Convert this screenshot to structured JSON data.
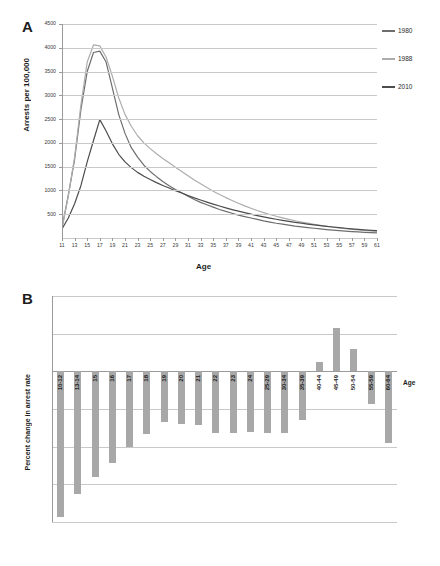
{
  "chart_data": [
    {
      "type": "line",
      "panel": "A",
      "title": "",
      "xlabel": "Age",
      "ylabel": "Arrests per 100,000",
      "xlim": [
        11,
        61
      ],
      "ylim": [
        0,
        4500
      ],
      "ytick_labels": [
        "0",
        "500",
        "1000",
        "1500",
        "2000",
        "2500",
        "3000",
        "3500",
        "4000",
        "4500"
      ],
      "xtick_labels": [
        "11",
        "13",
        "15",
        "17",
        "19",
        "21",
        "23",
        "25",
        "27",
        "29",
        "31",
        "33",
        "35",
        "37",
        "39",
        "41",
        "43",
        "45",
        "47",
        "49",
        "51",
        "53",
        "55",
        "57",
        "59",
        "61"
      ],
      "grid": true,
      "legend_position": "right",
      "x": [
        11,
        12,
        13,
        14,
        15,
        16,
        17,
        18,
        19,
        20,
        21,
        22,
        23,
        24,
        25,
        26,
        27,
        28,
        29,
        30,
        31,
        32,
        33,
        34,
        35,
        36,
        37,
        38,
        39,
        40,
        41,
        42,
        43,
        44,
        45,
        46,
        47,
        48,
        49,
        50,
        51,
        52,
        53,
        54,
        55,
        56,
        57,
        58,
        59,
        60,
        61
      ],
      "series": [
        {
          "name": "1980",
          "color": "#6e6e6e",
          "values": [
            210,
            900,
            1650,
            2700,
            3500,
            3900,
            3930,
            3700,
            3150,
            2600,
            2200,
            1900,
            1700,
            1530,
            1400,
            1290,
            1190,
            1100,
            1020,
            950,
            880,
            810,
            750,
            700,
            650,
            600,
            560,
            520,
            480,
            450,
            420,
            390,
            360,
            335,
            310,
            290,
            270,
            250,
            235,
            220,
            205,
            190,
            178,
            166,
            155,
            145,
            136,
            128,
            120,
            113,
            106
          ]
        },
        {
          "name": "1988",
          "color": "#adadad",
          "values": [
            200,
            880,
            1700,
            2800,
            3700,
            4060,
            4040,
            3800,
            3400,
            2950,
            2600,
            2350,
            2150,
            2000,
            1880,
            1770,
            1670,
            1580,
            1490,
            1400,
            1310,
            1220,
            1140,
            1060,
            985,
            915,
            850,
            790,
            730,
            675,
            625,
            578,
            535,
            495,
            458,
            424,
            392,
            363,
            336,
            311,
            288,
            267,
            247,
            229,
            212,
            197,
            183,
            170,
            158,
            147,
            137
          ]
        },
        {
          "name": "2010",
          "color": "#4d4d4d",
          "values": [
            190,
            420,
            720,
            1100,
            1600,
            2050,
            2490,
            2250,
            1980,
            1760,
            1600,
            1480,
            1380,
            1300,
            1230,
            1165,
            1105,
            1050,
            995,
            945,
            895,
            845,
            800,
            755,
            712,
            672,
            634,
            598,
            564,
            532,
            501,
            472,
            445,
            419,
            395,
            372,
            350,
            330,
            311,
            293,
            276,
            260,
            245,
            231,
            218,
            205,
            193,
            182,
            172,
            162,
            153
          ]
        }
      ]
    },
    {
      "type": "bar",
      "panel": "B",
      "title": "",
      "xlabel": "Age",
      "ylabel": "Percent change in arrest rate",
      "ylim": [
        -80,
        40
      ],
      "ytick_labels": [
        "40",
        "20",
        "0",
        "-20",
        "-40",
        "-60",
        "-80"
      ],
      "grid": true,
      "bar_color": "#a8a8a8",
      "categories": [
        "10-12",
        "13-14",
        "15",
        "16",
        "17",
        "18",
        "19",
        "20",
        "21",
        "22",
        "23",
        "24",
        "25-29",
        "30-34",
        "35-39",
        "40-44",
        "45-49",
        "50-54",
        "55-59",
        "60-64"
      ],
      "values": [
        -77.5,
        -65,
        -56,
        -48.5,
        -40,
        -33.5,
        -27,
        -28,
        -28.5,
        -33,
        -33,
        -32,
        -33,
        -33,
        -26,
        5,
        23,
        12,
        -17.5,
        -38
      ]
    }
  ],
  "panel_a": {
    "letter": "A",
    "ylabel": "Arrests per 100,000",
    "xlabel": "Age",
    "legend": [
      {
        "label": "1980",
        "color": "#6e6e6e"
      },
      {
        "label": "1988",
        "color": "#adadad"
      },
      {
        "label": "2010",
        "color": "#4d4d4d"
      }
    ]
  },
  "panel_b": {
    "letter": "B",
    "ylabel": "Percent change in arrest rate",
    "age_tag": "Age"
  }
}
